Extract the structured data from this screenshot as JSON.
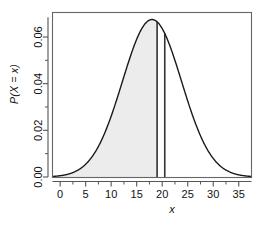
{
  "chart_data": {
    "type": "area",
    "title": "",
    "xlabel": "x",
    "ylabel": "P(X = x)",
    "xlim": [
      -1.5,
      37.5
    ],
    "ylim": [
      0,
      0.0705
    ],
    "grid": false,
    "legend": null,
    "distribution": {
      "shape": "bell-curve",
      "mean": 18,
      "sd": 5.8,
      "peak_value": 0.0675,
      "peak_x": 18
    },
    "x_ticks": [
      0,
      5,
      10,
      15,
      20,
      25,
      30,
      35
    ],
    "x_tick_labels": [
      "0",
      "5",
      "10",
      "15",
      "20",
      "25",
      "30",
      "35"
    ],
    "x_minor_ticks": [
      2.5,
      7.5,
      12.5,
      17.5,
      22.5,
      27.5,
      32.5
    ],
    "y_ticks": [
      0.0,
      0.02,
      0.04,
      0.06
    ],
    "y_tick_labels": [
      "0.00",
      "0.02",
      "0.04",
      "0.06"
    ],
    "y_minor_ticks": [
      0.01,
      0.03,
      0.05,
      0.07
    ],
    "shaded_region": {
      "from_x": -1.5,
      "to_x": 19.0,
      "fill_color": "#ececec",
      "description": "left-tail cumulative area shaded up to x = 19"
    },
    "vertical_lines": [
      {
        "x": 19.0,
        "color": "#333333",
        "width_px": 1.6
      },
      {
        "x": 20.5,
        "color": "#333333",
        "width_px": 1.6
      }
    ],
    "curve_color": "#1a1a1a",
    "axis_color": "#555555",
    "series": [
      {
        "name": "P(X = x)",
        "x": [
          -1.5,
          0,
          1,
          2,
          3,
          4,
          5,
          6,
          7,
          8,
          9,
          10,
          11,
          12,
          13,
          14,
          15,
          16,
          17,
          18,
          19,
          20,
          21,
          22,
          23,
          24,
          25,
          26,
          27,
          28,
          29,
          30,
          31,
          32,
          33,
          34,
          35,
          36,
          37.5
        ],
        "values": [
          0.0,
          0.0006,
          0.0013,
          0.0025,
          0.0045,
          0.0076,
          0.012,
          0.0179,
          0.0253,
          0.0337,
          0.0426,
          0.0511,
          0.0583,
          0.0634,
          0.0665,
          0.0675,
          0.067,
          0.065,
          0.0669,
          0.0675,
          0.0655,
          0.0613,
          0.0551,
          0.0474,
          0.0391,
          0.0308,
          0.0232,
          0.0167,
          0.0115,
          0.0075,
          0.0047,
          0.0028,
          0.0016,
          0.0009,
          0.0004,
          0.0002,
          0.0001,
          0.0,
          0.0
        ]
      }
    ]
  },
  "axes": {
    "x_title": "x",
    "y_title": "P(X = x)"
  }
}
